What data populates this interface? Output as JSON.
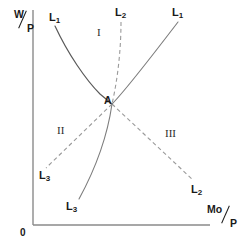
{
  "figure": {
    "background_color": "#ffffff",
    "line_color": "#555555",
    "axis_color": "#7a7a7a",
    "text_color": "#1a1a1a",
    "width": 243,
    "height": 247
  },
  "axes": {
    "y": {
      "numerator": "W",
      "denominator": "P",
      "separator": "/"
    },
    "x": {
      "numerator": "Mo",
      "denominator": "P",
      "separator": "/"
    },
    "origin_label": "0"
  },
  "intersection": {
    "label": "A",
    "x": 112,
    "y": 104
  },
  "regions": [
    {
      "label": "I",
      "x": 97,
      "y": 32
    },
    {
      "label": "II",
      "x": 57,
      "y": 130
    },
    {
      "label": "III",
      "x": 167,
      "y": 133
    }
  ],
  "curve_labels": [
    {
      "base": "L",
      "sub": "1",
      "x": 52,
      "y": 14,
      "curve": "L1-left-solid"
    },
    {
      "base": "L",
      "sub": "2",
      "x": 118,
      "y": 9,
      "curve": "L2-upper-dashed"
    },
    {
      "base": "L",
      "sub": "1",
      "x": 176,
      "y": 9,
      "curve": "L1-right-solid"
    },
    {
      "base": "L",
      "sub": "3",
      "x": 42,
      "y": 172,
      "curve": "L3-left-dashed"
    },
    {
      "base": "L",
      "sub": "3",
      "x": 68,
      "y": 202,
      "curve": "L3-lower-solid"
    },
    {
      "base": "L",
      "sub": "2",
      "x": 194,
      "y": 186,
      "curve": "L2-lower-dashed"
    }
  ],
  "curves": [
    {
      "name": "L1-left-solid",
      "style": "solid",
      "description": "downward convex curve from upper-left to point A"
    },
    {
      "name": "L1-right-solid",
      "style": "solid",
      "description": "upward curve from point A to upper-right"
    },
    {
      "name": "L2-upper-dashed",
      "style": "dashed",
      "description": "near-vertical dashed line from top to point A"
    },
    {
      "name": "L2-lower-dashed",
      "style": "dashed",
      "description": "dashed line from point A to lower-right"
    },
    {
      "name": "L3-left-dashed",
      "style": "dashed",
      "description": "dashed line from point A to lower-left"
    },
    {
      "name": "L3-lower-solid",
      "style": "solid",
      "description": "solid curve from point A down to bottom-centre-left"
    }
  ]
}
